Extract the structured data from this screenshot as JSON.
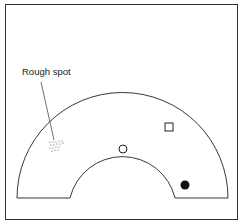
{
  "diagram": {
    "labels": {
      "rough_spot": "Rough spot"
    },
    "markers": [
      {
        "type": "open-circle",
        "name": "ball-open"
      },
      {
        "type": "open-square",
        "name": "square-marker"
      },
      {
        "type": "filled-circle",
        "name": "ball-filled"
      }
    ],
    "colors": {
      "stroke": "#222222",
      "background": "#ffffff"
    }
  }
}
